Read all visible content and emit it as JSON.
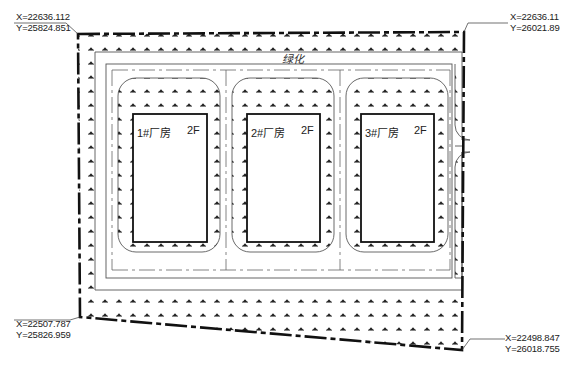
{
  "drawing": {
    "type": "site-plan",
    "colors": {
      "line": "#111111",
      "thin_line": "#555555",
      "background": "#ffffff",
      "hatch": "#222222"
    }
  },
  "corner_coordinates": {
    "top_left": {
      "x": "X=22636.112",
      "y": "Y=25824.851"
    },
    "top_right": {
      "x": "X=22636.11",
      "y": "Y=26021.89"
    },
    "bottom_left": {
      "x": "X=22507.787",
      "y": "Y=25826.959"
    },
    "bottom_right": {
      "x": "X=22498.847",
      "y": "Y=26018.755"
    }
  },
  "site_label": "绿化",
  "buildings": [
    {
      "name": "1#厂房",
      "floors": "2F"
    },
    {
      "name": "2#厂房",
      "floors": "2F"
    },
    {
      "name": "3#厂房",
      "floors": "2F"
    }
  ],
  "icons": {
    "hatch": "grass-hatch-icon"
  }
}
